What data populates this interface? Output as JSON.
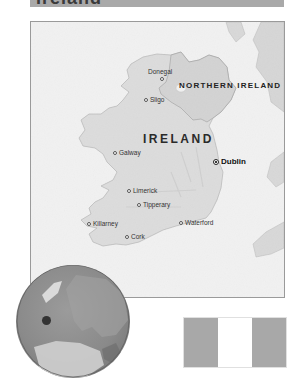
{
  "title": "Ireland",
  "colors": {
    "title_bar": "#a9a9a9",
    "sea": "#f1f1f1",
    "land_ireland": "#dcdcdc",
    "land_ni": "#d4d4d4",
    "flag_left": "#a8a8a8",
    "flag_middle": "#ffffff",
    "flag_right": "#a8a8a8"
  },
  "map": {
    "countries": [
      {
        "label": "NORTHERN IRELAND"
      },
      {
        "label": "IRELAND"
      }
    ],
    "capital": {
      "label": "Dublin"
    },
    "cities": [
      {
        "label": "Donegal"
      },
      {
        "label": "Sligo"
      },
      {
        "label": "Galway"
      },
      {
        "label": "Limerick"
      },
      {
        "label": "Tipperary"
      },
      {
        "label": "Killarney"
      },
      {
        "label": "Cork"
      },
      {
        "label": "Waterford"
      }
    ]
  },
  "locator_globe": {
    "marker": "Ireland location dot"
  },
  "flag": {
    "stripes": [
      "green",
      "white",
      "orange"
    ]
  }
}
